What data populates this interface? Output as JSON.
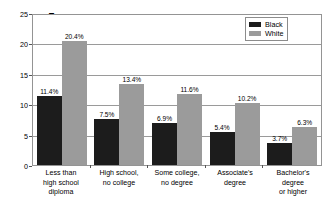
{
  "chart_data": {
    "type": "bar",
    "title": "",
    "xlabel": "",
    "ylabel": "Percent Unemployed",
    "ylim": [
      0,
      25
    ],
    "yticks": [
      0,
      5,
      10,
      15,
      20,
      25
    ],
    "grid": true,
    "legend_position": "top-right",
    "categories": [
      "Less than\nhigh school\ndiploma",
      "High school,\nno college",
      "Some college,\nno degree",
      "Associate's\ndegree",
      "Bachelor's\ndegree\nor higher"
    ],
    "series": [
      {
        "name": "Black",
        "color": "#1c1c1c",
        "values": [
          11.4,
          7.5,
          6.9,
          5.4,
          3.7
        ],
        "labels": [
          "11.4%",
          "7.5%",
          "6.9%",
          "5.4%",
          "3.7%"
        ]
      },
      {
        "name": "White",
        "color": "#9b9b9b",
        "values": [
          20.4,
          13.4,
          11.6,
          10.2,
          6.3
        ],
        "labels": [
          "20.4%",
          "13.4%",
          "11.6%",
          "10.2%",
          "6.3%"
        ]
      }
    ]
  },
  "axes": {
    "y_title": "Percent Unemployed",
    "y_tick_labels": [
      "25",
      "20",
      "15",
      "10",
      "5",
      "0"
    ]
  },
  "categories": [
    {
      "lines": [
        "Less than",
        "high school",
        "diploma"
      ]
    },
    {
      "lines": [
        "High school,",
        "no college"
      ]
    },
    {
      "lines": [
        "Some college,",
        "no degree"
      ]
    },
    {
      "lines": [
        "Associate's",
        "degree"
      ]
    },
    {
      "lines": [
        "Bachelor's",
        "degree",
        "or higher"
      ]
    }
  ],
  "legend": {
    "items": [
      {
        "label": "Black",
        "swatch": "black"
      },
      {
        "label": "White",
        "swatch": "white"
      }
    ]
  }
}
